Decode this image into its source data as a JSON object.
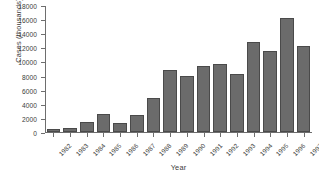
{
  "chart_data": {
    "type": "bar",
    "title": "",
    "xlabel": "Year",
    "ylabel": "Cases (thousands)",
    "categories": [
      "1982",
      "1983",
      "1984",
      "1985",
      "1986",
      "1987",
      "1988",
      "1989",
      "1990",
      "1991",
      "1992",
      "1993",
      "1994",
      "1995",
      "1996",
      "1997"
    ],
    "values": [
      400,
      600,
      1400,
      2600,
      1300,
      2400,
      4800,
      8800,
      8000,
      9400,
      9700,
      8200,
      12800,
      11500,
      16200,
      12200
    ],
    "ylim": [
      0,
      18000
    ],
    "yticks": [
      0,
      2000,
      4000,
      6000,
      8000,
      10000,
      12000,
      14000,
      16000,
      18000
    ],
    "ytick_labels": [
      "0",
      "2000",
      "4000",
      "6000",
      "8000",
      "10000",
      "12000",
      "14000",
      "16000",
      "18000"
    ],
    "grid": false,
    "legend": false,
    "bar_color": "#6b6b6b",
    "bar_edge_color": "#4a4a4a",
    "axis_color": "#6e6e6e",
    "text_color": "#3b3b3b",
    "background": "#ffffff"
  }
}
